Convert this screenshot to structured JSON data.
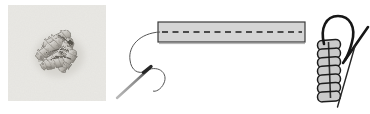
{
  "canvas": {
    "width": 370,
    "height": 114,
    "background": "#ffffff"
  },
  "colors": {
    "canvas_bg": "#ffffff",
    "fabric": "#e9e8e4",
    "fabric_shadow": "#d6d4cf",
    "stitch_light": "#dddbd7",
    "stitch_dark": "#97938c",
    "stitch_crevice": "#4e4a44",
    "band_fill": "#d5d5d5",
    "band_border": "#3a3a3a",
    "band_shadow": "#9a9a9a",
    "dash_line": "#4a4a4a",
    "fine_thread": "#555555",
    "thread": "#161616",
    "needle_light": "#9a9a9a",
    "needle_dark": "#262626",
    "coil_fill": "#cbcbcb",
    "coil_outline": "#1c1c1c"
  },
  "panels": {
    "photo": {
      "icon": "bullion-knot-photo"
    },
    "band": {
      "icon": "stitch-band-diagram",
      "dash_pattern": "6 4.5"
    },
    "coil": {
      "icon": "bullion-coil-diagram",
      "segments": 7
    }
  }
}
